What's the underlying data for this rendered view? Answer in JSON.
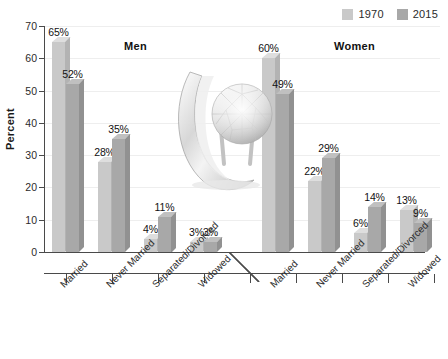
{
  "chart_data": {
    "type": "bar",
    "title": "",
    "xlabel": "",
    "ylabel": "Percent",
    "ylim": [
      0,
      70
    ],
    "ytick_step": 10,
    "yticks": [
      0,
      10,
      20,
      30,
      40,
      50,
      60,
      70
    ],
    "grid": true,
    "legend_position": "top-right",
    "value_suffix": "%",
    "categories": [
      "Married",
      "Never Married",
      "Separated/Divorced",
      "Widowed"
    ],
    "groups": [
      {
        "name": "Men",
        "series": [
          {
            "name": "1970",
            "values": [
              65,
              28,
              4,
              3
            ]
          },
          {
            "name": "2015",
            "values": [
              52,
              35,
              11,
              3
            ]
          }
        ]
      },
      {
        "name": "Women",
        "series": [
          {
            "name": "1970",
            "values": [
              60,
              22,
              6,
              13
            ]
          },
          {
            "name": "2015",
            "values": [
              49,
              29,
              14,
              9
            ]
          }
        ]
      }
    ],
    "series_names": [
      "1970",
      "2015"
    ],
    "colors": {
      "series_1970": "#c9c9c9",
      "series_2015": "#a8a8a8",
      "series_1970_top": "#dedede",
      "series_2015_top": "#c0c0c0",
      "series_1970_side": "#b3b3b3",
      "series_2015_side": "#919191",
      "axis": "#4a4a4a",
      "grid": "#eeeeee",
      "text": "#1a1a1a",
      "background": "#ffffff"
    },
    "data_labels": [
      "65%",
      "52%",
      "28%",
      "35%",
      "4%",
      "11%",
      "3%",
      "3%",
      "60%",
      "49%",
      "22%",
      "29%",
      "6%",
      "14%",
      "13%",
      "9%"
    ]
  },
  "legend": {
    "entries": [
      {
        "label": "1970"
      },
      {
        "label": "2015"
      }
    ]
  },
  "decoration": {
    "image_name": "diamond-engagement-ring-photo"
  }
}
